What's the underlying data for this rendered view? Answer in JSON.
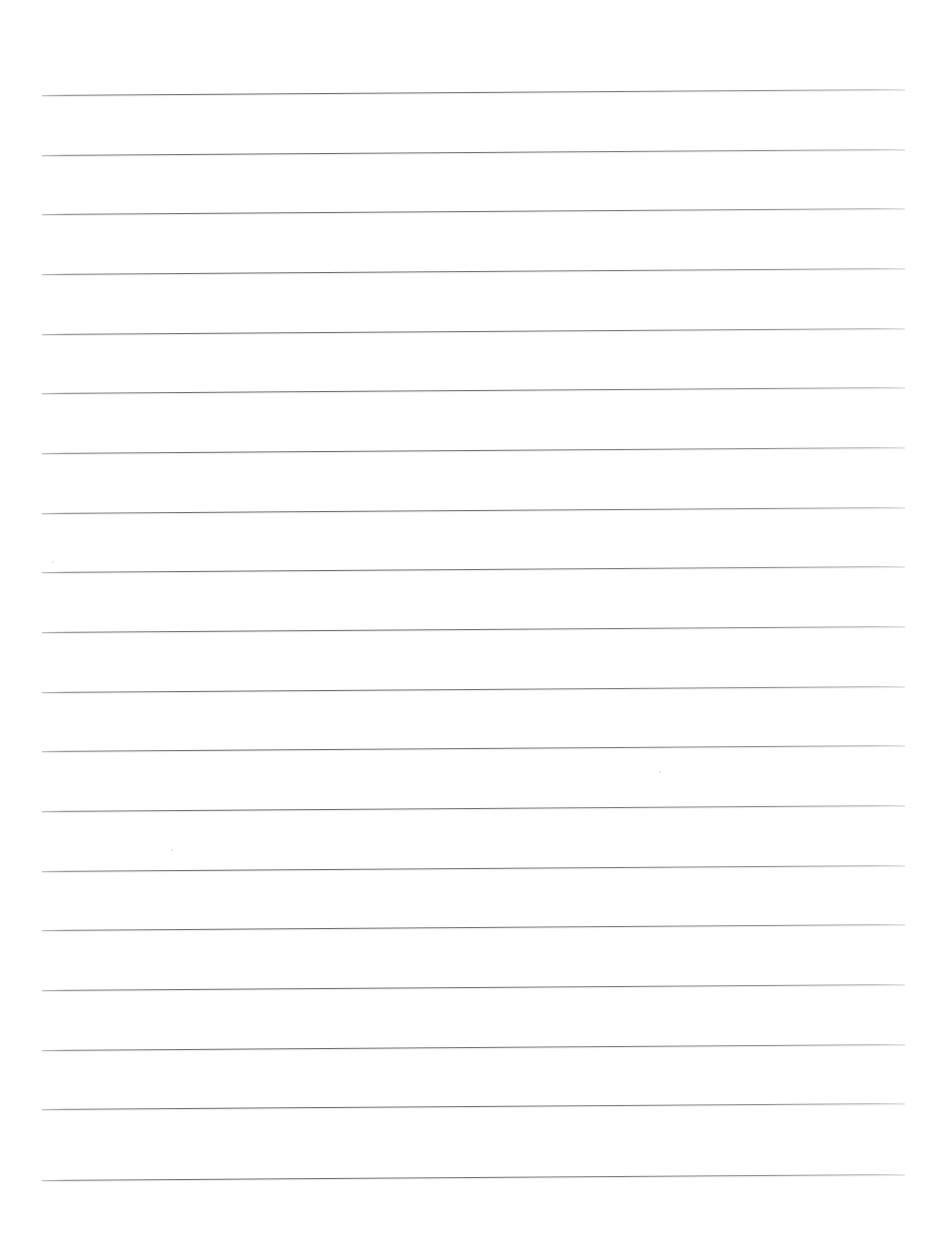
{
  "document": {
    "kind": "scanned-lined-paper",
    "title": "Blank Ruled Notebook Page",
    "content_text": "",
    "page_width": 944,
    "page_height": 1248,
    "background_color": "#ffffff",
    "rule_color": "#76767a",
    "rule_thickness_px": 1,
    "rule_count": 19,
    "rule_left_x": 42,
    "rule_right_x": 905,
    "rule_spacing_px": 59.7,
    "first_rule_y_left": 95,
    "first_rule_y_right": 89,
    "scan_skew_degrees": -0.4,
    "margin_line": "none",
    "header_text": "",
    "footer_text": "",
    "page_number": ""
  },
  "ruled_lines": [
    {
      "index": 1,
      "y_left": 95,
      "y_right": 89
    },
    {
      "index": 2,
      "y_left": 155,
      "y_right": 149
    },
    {
      "index": 3,
      "y_left": 214,
      "y_right": 208
    },
    {
      "index": 4,
      "y_left": 274,
      "y_right": 268
    },
    {
      "index": 5,
      "y_left": 334,
      "y_right": 328
    },
    {
      "index": 6,
      "y_left": 393,
      "y_right": 387
    },
    {
      "index": 7,
      "y_left": 453,
      "y_right": 447
    },
    {
      "index": 8,
      "y_left": 513,
      "y_right": 507
    },
    {
      "index": 9,
      "y_left": 572,
      "y_right": 566
    },
    {
      "index": 10,
      "y_left": 632,
      "y_right": 626
    },
    {
      "index": 11,
      "y_left": 692,
      "y_right": 686
    },
    {
      "index": 12,
      "y_left": 751,
      "y_right": 745
    },
    {
      "index": 13,
      "y_left": 811,
      "y_right": 805
    },
    {
      "index": 14,
      "y_left": 871,
      "y_right": 865
    },
    {
      "index": 15,
      "y_left": 930,
      "y_right": 924
    },
    {
      "index": 16,
      "y_left": 990,
      "y_right": 984
    },
    {
      "index": 17,
      "y_left": 1050,
      "y_right": 1044
    },
    {
      "index": 18,
      "y_left": 1109,
      "y_right": 1103
    },
    {
      "index": 19,
      "y_left": 1180,
      "y_right": 1174
    }
  ],
  "artifacts": {
    "specks": [
      {
        "x": 659,
        "y": 771,
        "size": 2
      },
      {
        "x": 171,
        "y": 849,
        "size": 2
      },
      {
        "x": 52,
        "y": 561,
        "size": 2
      }
    ]
  }
}
